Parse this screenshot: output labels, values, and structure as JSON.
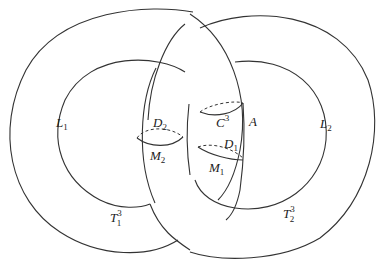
{
  "diagram": {
    "type": "linked solid tori",
    "labels": {
      "L1": "L",
      "L1_sub": "1",
      "L2": "L",
      "L2_sub": "2",
      "D2": "D",
      "D2_sub": "2",
      "M2": "M",
      "M2_sub": "2",
      "C3": "C",
      "C3_sup": "3",
      "A": "A",
      "D1": "D",
      "D1_sub": "1",
      "M1": "M",
      "M1_sub": "1",
      "T1": "T",
      "T1_sub": "1",
      "T1_sup": "3",
      "T2": "T",
      "T2_sub": "2",
      "T2_sup": "3"
    },
    "colors": {
      "stroke": "#333333",
      "background": "#ffffff"
    }
  }
}
